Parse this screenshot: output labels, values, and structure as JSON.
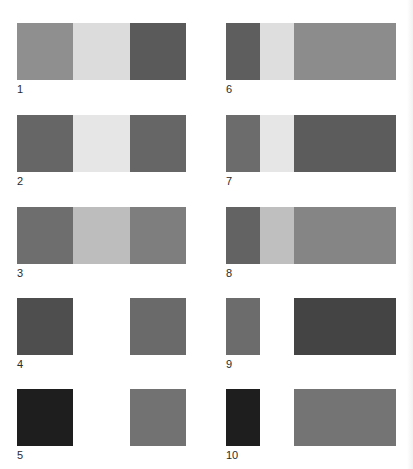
{
  "figure": {
    "panels": [
      {
        "label": "1",
        "column": "left",
        "row": 0,
        "segments": [
          {
            "color": "#8f8f8f",
            "w": 56
          },
          {
            "color": "#dcdcdc",
            "w": 57
          },
          {
            "color": "#5a5a5a",
            "w": 56
          }
        ]
      },
      {
        "label": "2",
        "column": "left",
        "row": 1,
        "segments": [
          {
            "color": "#666666",
            "w": 56
          },
          {
            "color": "#e6e6e6",
            "w": 57
          },
          {
            "color": "#666666",
            "w": 56
          }
        ]
      },
      {
        "label": "3",
        "column": "left",
        "row": 2,
        "segments": [
          {
            "color": "#6e6e6e",
            "w": 56
          },
          {
            "color": "#bdbdbd",
            "w": 57
          },
          {
            "color": "#7e7e7e",
            "w": 56
          }
        ]
      },
      {
        "label": "4",
        "column": "left",
        "row": 3,
        "segments": [
          {
            "color": "#4e4e4e",
            "w": 56
          },
          {
            "color": "#ffffff",
            "w": 57
          },
          {
            "color": "#6a6a6a",
            "w": 56
          }
        ]
      },
      {
        "label": "5",
        "column": "left",
        "row": 4,
        "segments": [
          {
            "color": "#1e1e1e",
            "w": 56
          },
          {
            "color": "#ffffff",
            "w": 57
          },
          {
            "color": "#727272",
            "w": 56
          }
        ]
      },
      {
        "label": "6",
        "column": "right",
        "row": 0,
        "segments": [
          {
            "color": "#5e5e5e",
            "w": 34
          },
          {
            "color": "#dedede",
            "w": 34
          },
          {
            "color": "#8c8c8c",
            "w": 102
          }
        ]
      },
      {
        "label": "7",
        "column": "right",
        "row": 1,
        "segments": [
          {
            "color": "#6c6c6c",
            "w": 34
          },
          {
            "color": "#e6e6e6",
            "w": 34
          },
          {
            "color": "#5c5c5c",
            "w": 102
          }
        ]
      },
      {
        "label": "8",
        "column": "right",
        "row": 2,
        "segments": [
          {
            "color": "#636363",
            "w": 34
          },
          {
            "color": "#bfbfbf",
            "w": 34
          },
          {
            "color": "#858585",
            "w": 102
          }
        ]
      },
      {
        "label": "9",
        "column": "right",
        "row": 3,
        "segments": [
          {
            "color": "#6c6c6c",
            "w": 34
          },
          {
            "color": "#ffffff",
            "w": 34
          },
          {
            "color": "#444444",
            "w": 102
          }
        ]
      },
      {
        "label": "10",
        "column": "right",
        "row": 4,
        "segments": [
          {
            "color": "#1e1e1e",
            "w": 34
          },
          {
            "color": "#ffffff",
            "w": 34
          },
          {
            "color": "#747474",
            "w": 102
          }
        ]
      }
    ]
  },
  "layout": {
    "column_x": {
      "left": 17,
      "right": 226
    },
    "row_y": [
      23,
      115,
      207,
      298,
      389
    ],
    "strip_height": 57,
    "label_offset_y": 61
  }
}
